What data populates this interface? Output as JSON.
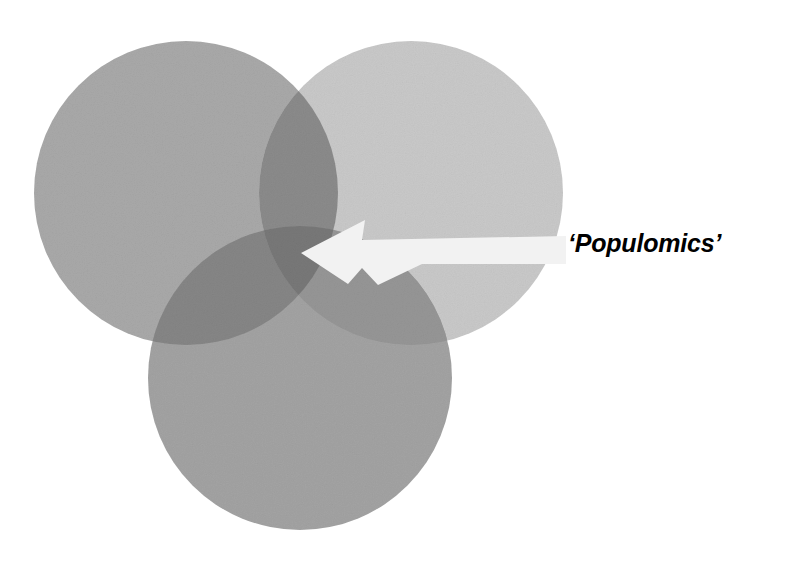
{
  "figure": {
    "title_visible": false,
    "background_color": "#ffffff",
    "canvas": {
      "width": 790,
      "height": 561
    }
  },
  "annotation": {
    "label": "‘Populomics’",
    "plain_text": "'Populomics'",
    "color": "#000000",
    "font_size_px": 25,
    "position": {
      "x": 568,
      "y": 228
    },
    "pointer": {
      "icon": "arrow-left-icon",
      "color": "#f2f2f2",
      "tip": {
        "x": 301,
        "y": 253
      },
      "tail": {
        "x": 566,
        "y": 250
      }
    }
  },
  "chart_data": {
    "type": "venn",
    "title": "",
    "subtitle": "",
    "xlabel": "",
    "ylabel": "",
    "legend_position": "none",
    "grid": false,
    "set_count": 3,
    "sets": [
      {
        "name": "set-top-left",
        "label": "",
        "center": {
          "x": 186,
          "y": 193
        },
        "radius": 152,
        "fill": "#a9a9a9",
        "opacity": 1
      },
      {
        "name": "set-top-right",
        "label": "",
        "center": {
          "x": 411,
          "y": 193
        },
        "radius": 152,
        "fill": "#c9c9c9",
        "opacity": 1
      },
      {
        "name": "set-bottom",
        "label": "",
        "center": {
          "x": 300,
          "y": 378
        },
        "radius": 152,
        "fill": "#a3a3a3",
        "opacity": 1
      }
    ],
    "regions": [
      {
        "name": "top-left-only",
        "fill": "#a9a9a9"
      },
      {
        "name": "top-right-only",
        "fill": "#c9c9c9"
      },
      {
        "name": "bottom-only",
        "fill": "#a3a3a3"
      },
      {
        "name": "top-left-and-top-right",
        "fill": "#8b8b8b"
      },
      {
        "name": "top-left-and-bottom",
        "fill": "#868686"
      },
      {
        "name": "top-right-and-bottom",
        "fill": "#969696"
      },
      {
        "name": "all-three",
        "fill": "#787878"
      }
    ],
    "highlighted_region": "all-three",
    "annotations": [
      {
        "text": "‘Populomics’",
        "points_to": "all-three"
      }
    ]
  }
}
